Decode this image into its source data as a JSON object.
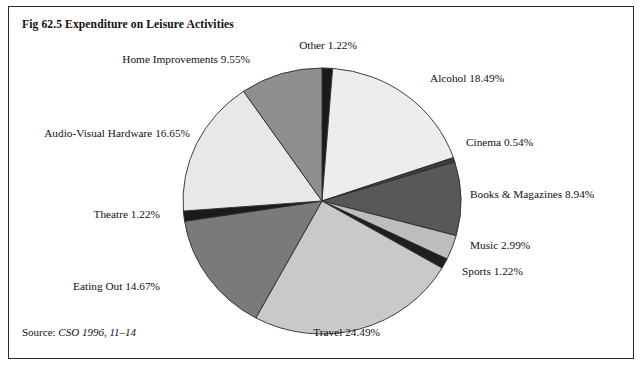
{
  "figure": {
    "title": "Fig 62.5 Expenditure on Leisure Activities",
    "source_label": "Source:",
    "source_value": "CSO 1996, 11–14"
  },
  "chart_data": {
    "type": "pie",
    "title": "Fig 62.5 Expenditure on Leisure Activities",
    "xlabel": "",
    "ylabel": "",
    "units": "percent",
    "start_angle_deg": 0,
    "direction": "clockwise",
    "legend": "none (labels placed around pie)",
    "grid": false,
    "categories": [
      "Other",
      "Alcohol",
      "Cinema",
      "Books & Magazines",
      "Music",
      "Sports",
      "Travel",
      "Eating Out",
      "Theatre",
      "Audio-Visual Hardware",
      "Home Improvements"
    ],
    "values": [
      1.22,
      18.49,
      0.54,
      8.94,
      2.99,
      1.22,
      24.49,
      14.67,
      1.22,
      16.65,
      9.55
    ],
    "total": 99.98,
    "colors": [
      "#1a1a1a",
      "#ededed",
      "#3d3d3d",
      "#585858",
      "#bdbdbd",
      "#1f1f1f",
      "#c9c9c9",
      "#7a7a7a",
      "#1a1a1a",
      "#e8e8e8",
      "#8f8f8f"
    ],
    "slices": [
      {
        "name": "Other",
        "value": 1.22,
        "label": "Other 1.22%",
        "color": "#1a1a1a"
      },
      {
        "name": "Alcohol",
        "value": 18.49,
        "label": "Alcohol 18.49%",
        "color": "#ededed"
      },
      {
        "name": "Cinema",
        "value": 0.54,
        "label": "Cinema 0.54%",
        "color": "#3d3d3d"
      },
      {
        "name": "Books & Magazines",
        "value": 8.94,
        "label": "Books & Magazines 8.94%",
        "color": "#585858"
      },
      {
        "name": "Music",
        "value": 2.99,
        "label": "Music 2.99%",
        "color": "#bdbdbd"
      },
      {
        "name": "Sports",
        "value": 1.22,
        "label": "Sports 1.22%",
        "color": "#1f1f1f"
      },
      {
        "name": "Travel",
        "value": 24.49,
        "label": "Travel 24.49%",
        "color": "#c9c9c9"
      },
      {
        "name": "Eating Out",
        "value": 14.67,
        "label": "Eating Out 14.67%",
        "color": "#7a7a7a"
      },
      {
        "name": "Theatre",
        "value": 1.22,
        "label": "Theatre 1.22%",
        "color": "#1a1a1a"
      },
      {
        "name": "Audio-Visual Hardware",
        "value": 16.65,
        "label": "Audio-Visual Hardware 16.65%",
        "color": "#e8e8e8"
      },
      {
        "name": "Home Improvements",
        "value": 9.55,
        "label": "Home Improvements 9.55%",
        "color": "#8f8f8f"
      }
    ]
  },
  "labels": {
    "other": "Other 1.22%",
    "alcohol": "Alcohol 18.49%",
    "cinema": "Cinema 0.54%",
    "books": "Books & Magazines 8.94%",
    "music": "Music 2.99%",
    "sports": "Sports 1.22%",
    "travel": "Travel 24.49%",
    "eating_out": "Eating Out 14.67%",
    "theatre": "Theatre 1.22%",
    "audio_visual": "Audio-Visual Hardware 16.65%",
    "home_improvements": "Home Improvements 9.55%"
  }
}
